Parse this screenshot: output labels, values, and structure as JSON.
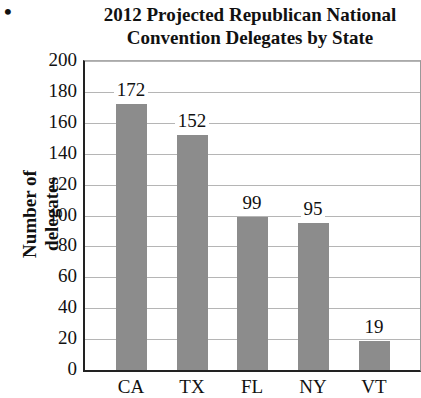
{
  "bullet": "•",
  "chart_data": {
    "type": "bar",
    "title": "2012 Projected Republican National Convention Delegates by State",
    "title_lines": [
      "2012 Projected Republican National",
      "Convention Delegates by State"
    ],
    "xlabel": "",
    "ylabel": "Number of delegates",
    "categories": [
      "CA",
      "TX",
      "FL",
      "NY",
      "VT"
    ],
    "values": [
      172,
      152,
      99,
      95,
      19
    ],
    "data_labels": [
      "172",
      "152",
      "99",
      "95",
      "19"
    ],
    "ylim": [
      0,
      200
    ],
    "yticks": [
      0,
      20,
      40,
      60,
      80,
      100,
      120,
      140,
      160,
      180,
      200
    ],
    "grid": true,
    "legend": null,
    "bar_color": "#8c8c8c"
  }
}
